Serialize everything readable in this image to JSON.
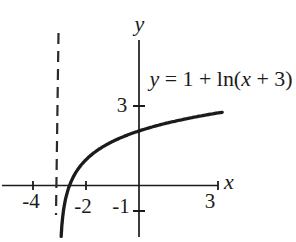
{
  "figure": {
    "equation": {
      "full": "y = 1 + ln(x + 3)",
      "lhs_var": "y",
      "mid": " = 1 + ln(",
      "inner_var": "x",
      "end": " + 3)"
    },
    "axis_labels": {
      "x": "x",
      "y": "y"
    },
    "tick_labels": {
      "x_neg4": "-4",
      "x_neg2": "-2",
      "x_pos3": "3",
      "y_pos3": "3",
      "y_neg1": "-1"
    }
  },
  "chart_data": {
    "type": "line",
    "title": "y = 1 + ln(x + 3)",
    "xlabel": "x",
    "ylabel": "y",
    "function": {
      "formula": "y = 1 + ln(x + 3)",
      "offset": 1,
      "shift": 3
    },
    "x_domain_drawn": [
      -2.948,
      3.15
    ],
    "xlim": [
      -5.2,
      3.2
    ],
    "ylim": [
      -2.2,
      5.6
    ],
    "x_ticks": [
      {
        "value": -4,
        "label": "-4"
      },
      {
        "value": -2,
        "label": "-2"
      },
      {
        "value": 3,
        "label": "3"
      }
    ],
    "y_ticks": [
      {
        "value": 3,
        "label": "3"
      },
      {
        "value": -1,
        "label": "-1"
      }
    ],
    "vertical_asymptote": {
      "x": -3,
      "style": "dashed"
    },
    "key_points": [
      [
        -2.95,
        -1.95
      ],
      [
        -2.63,
        0
      ],
      [
        -2,
        1
      ],
      [
        -1,
        1.69
      ],
      [
        0,
        2.1
      ],
      [
        1,
        2.39
      ],
      [
        2,
        2.61
      ],
      [
        3,
        2.79
      ]
    ],
    "grid": false,
    "legend": false,
    "colors": {
      "curve": "#1b1b1b",
      "axes": "#1b1b1b",
      "background": "#ffffff"
    }
  }
}
